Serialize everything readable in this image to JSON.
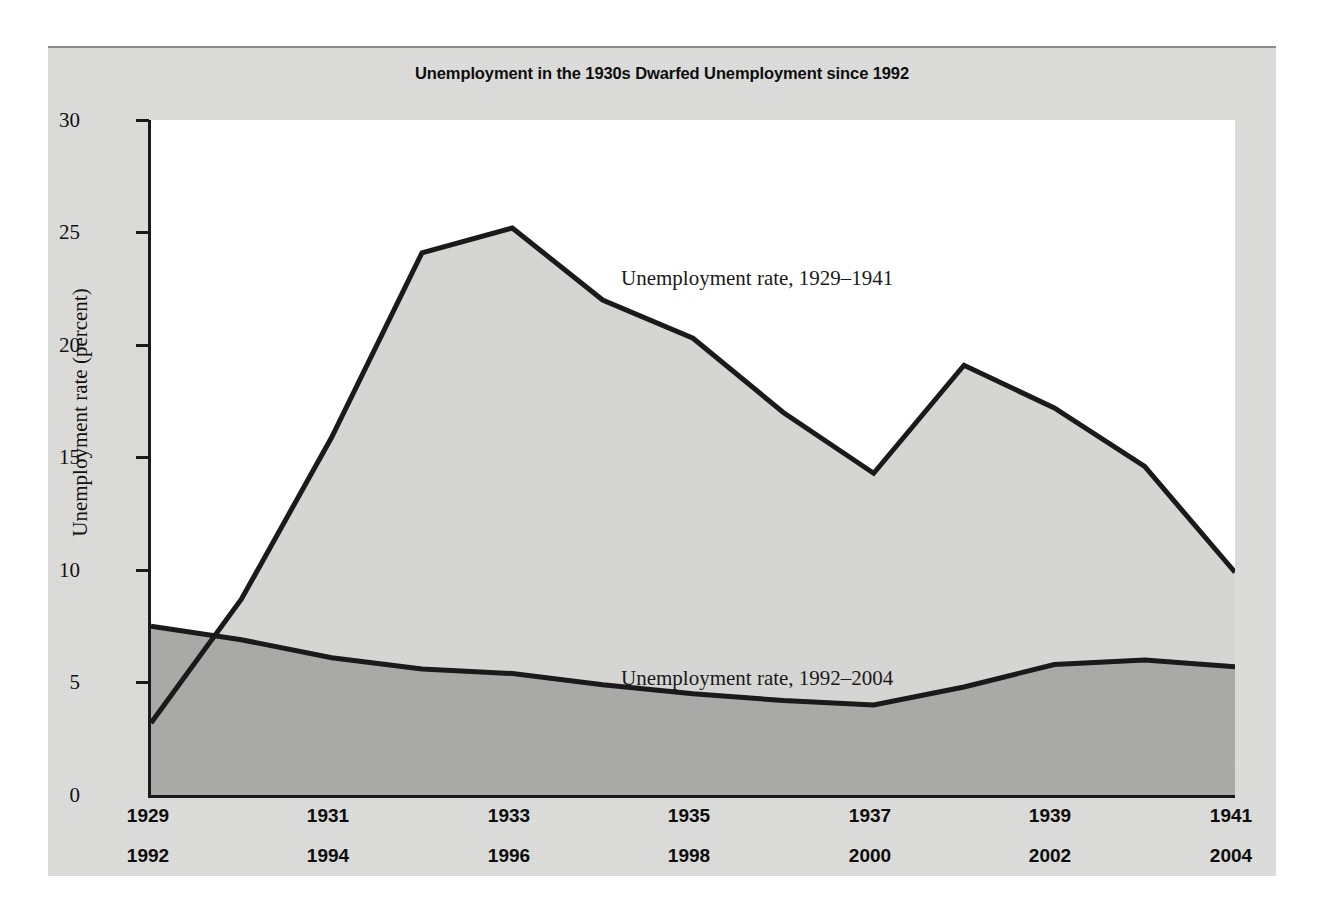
{
  "chart_data": {
    "type": "area",
    "title": "Unemployment in the 1930s Dwarfed Unemployment since 1992",
    "xlabel": "",
    "ylabel": "Unemployment rate (percent)",
    "ylim": [
      0,
      30
    ],
    "ytick_labels": [
      "30",
      "25",
      "20",
      "15",
      "10",
      "5",
      "0"
    ],
    "ytick_values": [
      30,
      25,
      20,
      15,
      10,
      5,
      0
    ],
    "grid": false,
    "legend_position": "inline-annotation",
    "x_axis_rows": [
      {
        "name": "1929-1941",
        "labels": [
          "1929",
          "1931",
          "1933",
          "1935",
          "1937",
          "1939",
          "1941"
        ],
        "values": [
          1929,
          1931,
          1933,
          1935,
          1937,
          1939,
          1941
        ]
      },
      {
        "name": "1992-2004",
        "labels": [
          "1992",
          "1994",
          "1996",
          "1998",
          "2000",
          "2002",
          "2004"
        ],
        "values": [
          1992,
          1994,
          1996,
          1998,
          2000,
          2002,
          2004
        ]
      }
    ],
    "x_index": [
      0,
      1,
      2,
      3,
      4,
      5,
      6,
      7,
      8,
      9,
      10,
      11,
      12
    ],
    "series": [
      {
        "name": "Unemployment rate, 1929–1941",
        "annotation": "Unemployment rate, 1929–1941",
        "x_labels": [
          "1929",
          "1930",
          "1931",
          "1932",
          "1933",
          "1934",
          "1935",
          "1936",
          "1937",
          "1938",
          "1939",
          "1940",
          "1941"
        ],
        "values": [
          3.2,
          8.7,
          15.9,
          24.1,
          25.2,
          22.0,
          20.3,
          17.0,
          14.3,
          19.1,
          17.2,
          14.6,
          9.9
        ],
        "fill_color": "#d5d5d3",
        "line_color": "#1a1a1a"
      },
      {
        "name": "Unemployment rate, 1992–2004",
        "annotation": "Unemployment rate, 1992–2004",
        "x_labels": [
          "1992",
          "1993",
          "1994",
          "1995",
          "1996",
          "1997",
          "1998",
          "1999",
          "2000",
          "2001",
          "2002",
          "2003",
          "2004"
        ],
        "values": [
          7.5,
          6.9,
          6.1,
          5.6,
          5.4,
          4.9,
          4.5,
          4.2,
          4.0,
          4.8,
          5.8,
          6.0,
          5.7
        ],
        "fill_color": "#a9a9a7",
        "line_color": "#1a1a1a"
      }
    ],
    "annotations": [
      {
        "text": "Unemployment rate, 1929–1941",
        "x_px": 570,
        "y_px": 232
      },
      {
        "text": "Unemployment rate, 1992–2004",
        "x_px": 570,
        "y_px": 632
      }
    ]
  }
}
